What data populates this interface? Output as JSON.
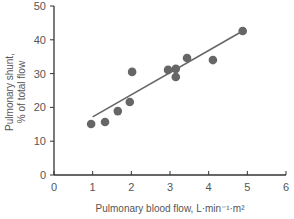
{
  "chart_data": {
    "type": "scatter",
    "title": "",
    "xlabel": "Pulmonary blood flow, L·min⁻¹·m²",
    "ylabel_line1": "Pulmonary shunt,",
    "ylabel_line2": "% of total flow",
    "xlim": [
      0,
      6
    ],
    "ylim": [
      0,
      50
    ],
    "x_ticks": [
      0,
      1,
      2,
      3,
      4,
      5,
      6
    ],
    "y_ticks": [
      0,
      10,
      20,
      30,
      40,
      50
    ],
    "grid": false,
    "legend": null,
    "series": [
      {
        "name": "observations",
        "color": "#666666",
        "points": [
          {
            "x": 0.96,
            "y": 15.1
          },
          {
            "x": 1.32,
            "y": 15.7
          },
          {
            "x": 1.65,
            "y": 18.9
          },
          {
            "x": 1.96,
            "y": 21.6
          },
          {
            "x": 2.02,
            "y": 30.5
          },
          {
            "x": 2.95,
            "y": 31.1
          },
          {
            "x": 3.15,
            "y": 31.4
          },
          {
            "x": 3.15,
            "y": 29.0
          },
          {
            "x": 3.44,
            "y": 34.6
          },
          {
            "x": 4.11,
            "y": 34.0
          },
          {
            "x": 4.88,
            "y": 42.6
          }
        ]
      }
    ],
    "regression_line": {
      "x1": 1.0,
      "y1": 17.2,
      "x2": 4.88,
      "y2": 42.6,
      "color": "#666666"
    }
  }
}
